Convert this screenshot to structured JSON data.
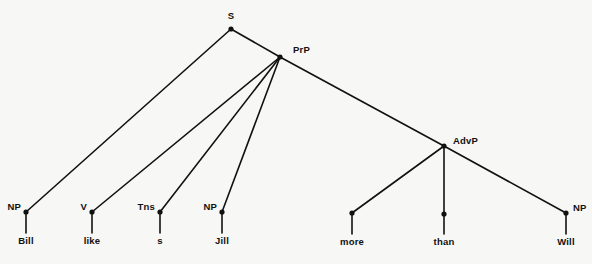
{
  "figure": {
    "kind": "syntax-tree-diagram",
    "sentence": "Bill likes Jill more than Will",
    "background_color": "#f7f7f5",
    "ink_color": "#111111",
    "width": 592,
    "height": 264
  },
  "nodes": {
    "s": {
      "label": "S",
      "x": 231,
      "y": 29,
      "label_x": 231,
      "label_y": 16,
      "anchor": "center"
    },
    "prp": {
      "label": "PrP",
      "x": 280,
      "y": 57,
      "label_x": 293,
      "label_y": 50,
      "anchor": "left"
    },
    "advp": {
      "label": "AdvP",
      "x": 444,
      "y": 146,
      "label_x": 453,
      "label_y": 141,
      "anchor": "left"
    },
    "np_bill": {
      "label": "NP",
      "x": 26,
      "y": 212,
      "label_x": 21,
      "label_y": 207,
      "anchor": "right"
    },
    "v_like": {
      "label": "V",
      "x": 92,
      "y": 212,
      "label_x": 87,
      "label_y": 207,
      "anchor": "right"
    },
    "tns": {
      "label": "Tns",
      "x": 160,
      "y": 212,
      "label_x": 155,
      "label_y": 207,
      "anchor": "right"
    },
    "np_jill": {
      "label": "NP",
      "x": 222,
      "y": 212,
      "label_x": 217,
      "label_y": 207,
      "anchor": "right"
    },
    "adv_more": {
      "label": "",
      "x": 352,
      "y": 213,
      "label_x": 352,
      "label_y": 213,
      "anchor": "center"
    },
    "adv_than": {
      "label": "",
      "x": 444,
      "y": 214,
      "label_x": 444,
      "label_y": 214,
      "anchor": "center"
    },
    "np_will": {
      "label": "NP",
      "x": 566,
      "y": 213,
      "label_x": 573,
      "label_y": 208,
      "anchor": "left"
    }
  },
  "words": [
    {
      "text": "Bill",
      "x": 26,
      "y": 241
    },
    {
      "text": "like",
      "x": 92,
      "y": 241
    },
    {
      "text": "s",
      "x": 160,
      "y": 241
    },
    {
      "text": "Jill",
      "x": 222,
      "y": 241
    },
    {
      "text": "more",
      "x": 352,
      "y": 242
    },
    {
      "text": "than",
      "x": 444,
      "y": 242
    },
    {
      "text": "Will",
      "x": 566,
      "y": 242
    }
  ],
  "edges": [
    {
      "name": "s-to-np-bill",
      "x1": 231,
      "y1": 29,
      "x2": 26,
      "y2": 212,
      "width": 1.6
    },
    {
      "name": "s-to-prp",
      "x1": 231,
      "y1": 29,
      "x2": 280,
      "y2": 57,
      "width": 1.6
    },
    {
      "name": "prp-to-v",
      "x1": 280,
      "y1": 57,
      "x2": 92,
      "y2": 212,
      "width": 1.6
    },
    {
      "name": "prp-to-tns",
      "x1": 280,
      "y1": 57,
      "x2": 160,
      "y2": 212,
      "width": 1.6
    },
    {
      "name": "prp-to-np-jill",
      "x1": 280,
      "y1": 57,
      "x2": 222,
      "y2": 212,
      "width": 1.6
    },
    {
      "name": "prp-to-advp",
      "x1": 280,
      "y1": 57,
      "x2": 444,
      "y2": 146,
      "width": 1.6
    },
    {
      "name": "advp-to-more",
      "x1": 444,
      "y1": 146,
      "x2": 352,
      "y2": 213,
      "width": 1.6
    },
    {
      "name": "advp-to-than",
      "x1": 444,
      "y1": 146,
      "x2": 444,
      "y2": 214,
      "width": 1.6
    },
    {
      "name": "advp-to-np-will",
      "x1": 444,
      "y1": 146,
      "x2": 566,
      "y2": 213,
      "width": 1.6
    }
  ],
  "terminal_stems": [
    {
      "name": "stem-bill",
      "x": 26,
      "y1": 212,
      "y2": 233,
      "width": 1.6
    },
    {
      "name": "stem-like",
      "x": 92,
      "y1": 212,
      "y2": 233,
      "width": 1.6
    },
    {
      "name": "stem-s",
      "x": 160,
      "y1": 212,
      "y2": 233,
      "width": 1.6
    },
    {
      "name": "stem-jill",
      "x": 222,
      "y1": 212,
      "y2": 233,
      "width": 1.6
    },
    {
      "name": "stem-more",
      "x": 352,
      "y1": 213,
      "y2": 234,
      "width": 1.6
    },
    {
      "name": "stem-than",
      "x": 444,
      "y1": 214,
      "y2": 234,
      "width": 1.6
    },
    {
      "name": "stem-will",
      "x": 566,
      "y1": 213,
      "y2": 234,
      "width": 1.6
    }
  ],
  "dot_radius": 2.6
}
